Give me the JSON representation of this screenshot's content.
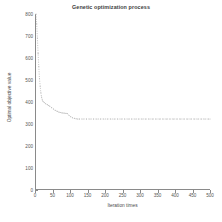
{
  "chart_data": {
    "type": "line",
    "title": "Genetic optimization process",
    "xlabel": "Iteration times",
    "ylabel": "Optimal objective value",
    "xlim": [
      0,
      500
    ],
    "ylim": [
      0,
      800
    ],
    "grid": false,
    "legend": null,
    "marker": "dotted",
    "line_color": "#b9b9b9",
    "xticks": [
      0,
      50,
      100,
      150,
      200,
      250,
      300,
      350,
      400,
      450,
      500
    ],
    "xtick_labels": [
      "0",
      "50",
      "100",
      "150",
      "200",
      "250",
      "300",
      "350",
      "400",
      "450",
      "500"
    ],
    "yticks": [
      0,
      100,
      200,
      300,
      400,
      500,
      600,
      700,
      800
    ],
    "ytick_labels": [
      "0",
      "100",
      "200",
      "300",
      "400",
      "500",
      "600",
      "700",
      "800"
    ],
    "series": [
      {
        "name": "Optimal objective value",
        "x": [
          0,
          2,
          4,
          6,
          8,
          10,
          12,
          14,
          16,
          18,
          20,
          24,
          28,
          32,
          36,
          40,
          45,
          50,
          55,
          60,
          65,
          70,
          75,
          80,
          85,
          90,
          95,
          100,
          105,
          110,
          115,
          120,
          125,
          135,
          145,
          155,
          165,
          175,
          185,
          195,
          205,
          215,
          225,
          235,
          245,
          255,
          265,
          275,
          285,
          295,
          305,
          315,
          325,
          335,
          345,
          355,
          365,
          375,
          385,
          395,
          405,
          415,
          425,
          435,
          445,
          455,
          465,
          475,
          485,
          495,
          500
        ],
        "y": [
          800,
          755,
          690,
          620,
          560,
          505,
          470,
          440,
          420,
          408,
          400,
          395,
          390,
          386,
          382,
          378,
          372,
          366,
          360,
          356,
          352,
          350,
          348,
          347,
          346,
          345,
          336,
          330,
          326,
          323,
          321,
          320,
          320,
          320,
          320,
          320,
          320,
          320,
          320,
          320,
          320,
          320,
          320,
          320,
          320,
          320,
          320,
          320,
          320,
          320,
          320,
          320,
          320,
          320,
          320,
          320,
          320,
          320,
          320,
          320,
          320,
          320,
          320,
          320,
          320,
          320,
          320,
          320,
          320,
          320,
          320
        ]
      }
    ]
  }
}
